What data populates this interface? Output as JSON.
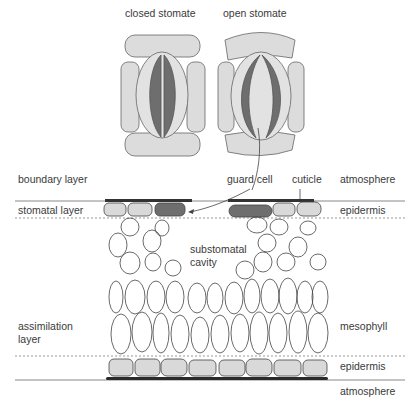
{
  "stomata": {
    "closed_label": "closed stomate",
    "open_label": "open stomate"
  },
  "left_labels": {
    "boundary": "boundary layer",
    "stomatal": "stomatal layer",
    "assimilation_1": "assimilation",
    "assimilation_2": "layer"
  },
  "right_labels": {
    "atmosphere_top": "atmosphere",
    "epidermis_top": "epidermis",
    "mesophyll": "mesophyll",
    "epidermis_bottom": "epidermis",
    "atmosphere_bottom": "atmosphere"
  },
  "annotations": {
    "guard_cell": "guard cell",
    "cuticle": "cuticle",
    "cavity_1": "substomatal",
    "cavity_2": "cavity"
  },
  "colors": {
    "cell_fill": "#d9d9d9",
    "guard_fill": "#6e6e6e",
    "outline": "#333333",
    "cuticle": "#2b2b2b"
  }
}
